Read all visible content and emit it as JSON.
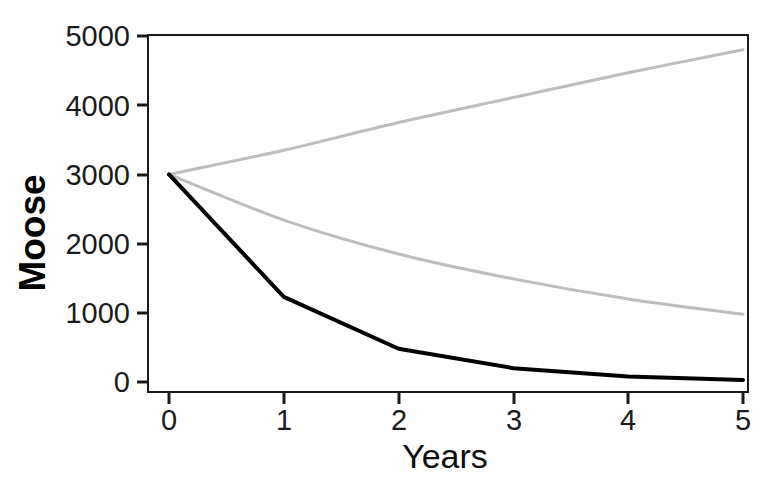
{
  "chart_data": {
    "type": "line",
    "title": "",
    "xlabel": "Years",
    "ylabel": "Moose",
    "xlim": [
      0,
      5
    ],
    "ylim": [
      0,
      5000
    ],
    "grid": false,
    "legend": "none",
    "x_ticks": [
      "0",
      "1",
      "2",
      "3",
      "4",
      "5"
    ],
    "y_ticks": [
      "0",
      "1000",
      "2000",
      "3000",
      "4000",
      "5000"
    ],
    "x": [
      0,
      1,
      2,
      3,
      4,
      5
    ],
    "series": [
      {
        "name": "increasing",
        "color": "#bdbdbd",
        "style": "solid",
        "values": [
          3000,
          3350,
          3750,
          4110,
          4470,
          4800
        ]
      },
      {
        "name": "declining-gray",
        "color": "#bdbdbd",
        "style": "solid",
        "values": [
          3000,
          2340,
          1850,
          1490,
          1200,
          980
        ]
      },
      {
        "name": "declining-black",
        "color": "#000000",
        "style": "solid",
        "values": [
          3000,
          1230,
          480,
          200,
          80,
          30
        ]
      }
    ]
  },
  "axis_titles": {
    "x": "Years",
    "y": "Moose"
  }
}
